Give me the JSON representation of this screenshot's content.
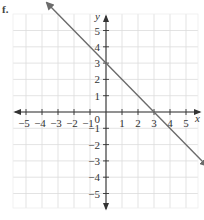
{
  "problem_marker": "f.",
  "chart_data": {
    "type": "line",
    "title": "",
    "xlabel": "x",
    "ylabel": "y",
    "xlim": [
      -5.8,
      5.8
    ],
    "ylim": [
      -6,
      6
    ],
    "grid": true,
    "x_ticks": [
      -5,
      -4,
      -3,
      -2,
      -1,
      0,
      1,
      2,
      3,
      4,
      5
    ],
    "y_ticks": [
      -5,
      -4,
      -3,
      -2,
      -1,
      1,
      2,
      3,
      4,
      5
    ],
    "x_tick_labels": [
      "−5",
      "−4",
      "−3",
      "−2",
      "−1",
      "1",
      "2",
      "3",
      "4",
      "5"
    ],
    "y_tick_labels": [
      "5",
      "4",
      "3",
      "2",
      "1",
      "−1",
      "−2",
      "−3",
      "−4",
      "−5"
    ],
    "origin_label": "0",
    "series": [
      {
        "name": "y = -x + 3",
        "equation": "y = -x + 3",
        "slope": -1,
        "y_intercept": 3,
        "x_intercept": 3,
        "x": [
          -3.7,
          6.3
        ],
        "y": [
          6.7,
          -3.3
        ],
        "arrows_both_ends": true,
        "color": "#6b6b6b"
      }
    ],
    "colors": {
      "grid": "#dcdcdc",
      "axis": "#333333",
      "line": "#6b6b6b"
    }
  }
}
